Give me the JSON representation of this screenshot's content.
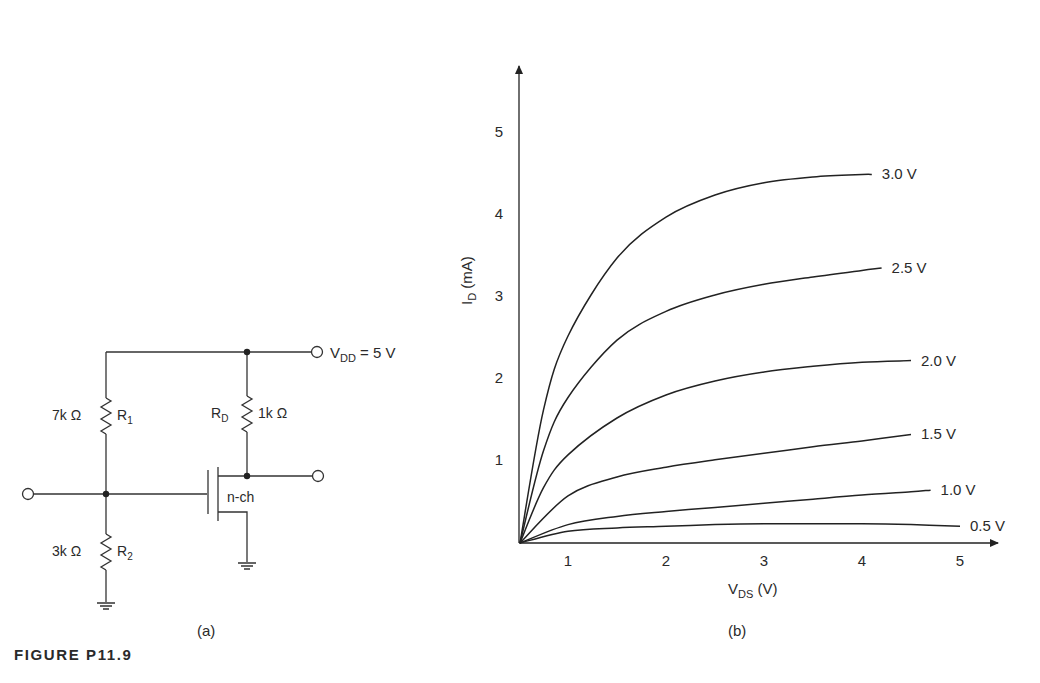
{
  "figure": {
    "caption": "FIGURE P11.9",
    "panel_a_label": "(a)",
    "panel_b_label": "(b)"
  },
  "circuit": {
    "vdd_label": "V",
    "vdd_sub": "DD",
    "vdd_value": " = 5 V",
    "r1_value": "7k Ω",
    "r1_name": "R",
    "r1_sub": "1",
    "r2_value": "3k Ω",
    "r2_name": "R",
    "r2_sub": "2",
    "rd_name": "R",
    "rd_sub": "D",
    "rd_value": "1k Ω",
    "transistor_type": "n-ch"
  },
  "chart_data": {
    "type": "line",
    "title": "",
    "xlabel": "V_DS (V)",
    "ylabel": "I_D (mA)",
    "xlabel_main": "V",
    "xlabel_sub": "DS",
    "xlabel_unit": " (V)",
    "ylabel_main": "I",
    "ylabel_sub": "D",
    "ylabel_unit": " (mA)",
    "x_ticks": [
      "1",
      "2",
      "3",
      "4",
      "5"
    ],
    "y_ticks": [
      "1",
      "2",
      "3",
      "4",
      "5"
    ],
    "xlim": [
      0.5,
      5.4
    ],
    "ylim": [
      0,
      5.6
    ],
    "grid": false,
    "legend_position": "inline labels at right end of each curve",
    "x": [
      0.5,
      1.0,
      1.5,
      2.0,
      2.5,
      3.0,
      3.5,
      4.0,
      4.5,
      5.0
    ],
    "series": [
      {
        "name": "3.0 V",
        "x": [
          0.5,
          0.75,
          1.0,
          1.5,
          2.0,
          2.5,
          3.0,
          3.5,
          4.0,
          4.1
        ],
        "values": [
          0,
          1.6,
          2.5,
          3.45,
          3.95,
          4.22,
          4.37,
          4.44,
          4.47,
          4.47
        ]
      },
      {
        "name": "2.5 V",
        "x": [
          0.5,
          0.75,
          1.0,
          1.5,
          2.0,
          2.5,
          3.0,
          3.5,
          4.0,
          4.2
        ],
        "values": [
          0,
          1.1,
          1.75,
          2.45,
          2.8,
          3.0,
          3.13,
          3.22,
          3.3,
          3.33
        ]
      },
      {
        "name": "2.0 V",
        "x": [
          0.5,
          0.75,
          1.0,
          1.5,
          2.0,
          2.5,
          3.0,
          3.5,
          4.0,
          4.5
        ],
        "values": [
          0,
          0.65,
          1.05,
          1.5,
          1.78,
          1.95,
          2.06,
          2.13,
          2.18,
          2.2
        ]
      },
      {
        "name": "1.5 V",
        "x": [
          0.5,
          1.0,
          1.5,
          2.0,
          2.5,
          3.0,
          3.5,
          4.0,
          4.5
        ],
        "values": [
          0,
          0.55,
          0.78,
          0.9,
          0.99,
          1.07,
          1.15,
          1.22,
          1.3
        ]
      },
      {
        "name": "1.0 V",
        "x": [
          0.5,
          1.0,
          1.5,
          2.0,
          2.5,
          3.0,
          3.5,
          4.0,
          4.5,
          4.7
        ],
        "values": [
          0,
          0.2,
          0.3,
          0.36,
          0.41,
          0.46,
          0.51,
          0.56,
          0.6,
          0.62
        ]
      },
      {
        "name": "0.5 V",
        "x": [
          0.5,
          1.0,
          1.5,
          2.0,
          2.5,
          3.0,
          3.5,
          4.0,
          4.5,
          5.0
        ],
        "values": [
          0,
          0.12,
          0.16,
          0.18,
          0.2,
          0.21,
          0.21,
          0.21,
          0.2,
          0.18
        ]
      }
    ]
  }
}
